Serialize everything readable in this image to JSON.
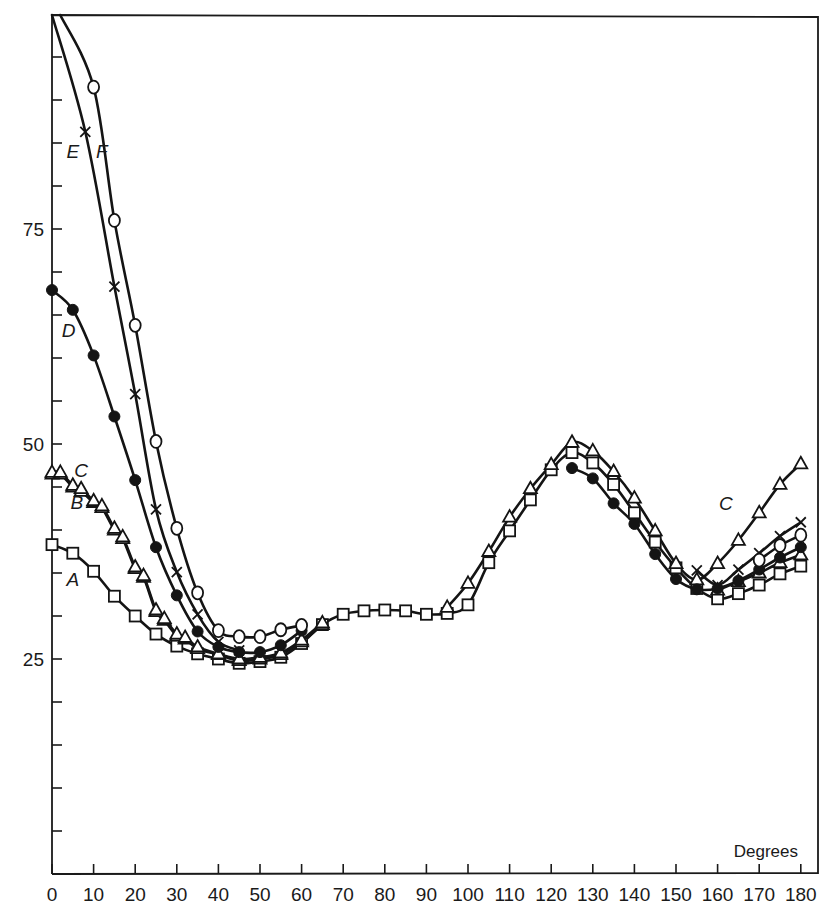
{
  "chart_data": {
    "type": "line",
    "title": "",
    "xlabel": "Degrees",
    "ylabel": "",
    "xlim": [
      0,
      180
    ],
    "ylim": [
      0,
      100
    ],
    "x_ticks": [
      0,
      10,
      20,
      30,
      40,
      50,
      60,
      70,
      80,
      90,
      100,
      110,
      120,
      130,
      140,
      150,
      160,
      170,
      180
    ],
    "x_tick_labels": [
      "0",
      "10",
      "20",
      "30",
      "40",
      "50",
      "60",
      "70",
      "80",
      "90",
      "100",
      "110",
      "120",
      "130",
      "140",
      "150",
      "160",
      "170",
      "180"
    ],
    "y_minor_ticks": [
      5,
      10,
      15,
      20,
      25,
      30,
      35,
      40,
      45,
      50,
      55,
      60,
      65,
      70,
      75,
      80,
      85,
      90,
      95
    ],
    "y_tick_labels": [
      {
        "value": 25,
        "label": "25"
      },
      {
        "value": 50,
        "label": "50"
      },
      {
        "value": 75,
        "label": "75"
      }
    ],
    "grid": false,
    "legend": "inline curve labels",
    "series": [
      {
        "name": "A",
        "marker": "open-square",
        "label_pos": {
          "x": 5,
          "y": 33.5
        },
        "x": [
          0,
          5,
          10,
          15,
          20,
          25,
          30,
          35,
          40,
          45,
          50,
          55,
          60,
          65,
          70,
          75,
          80,
          85,
          90,
          95,
          100,
          105,
          110,
          115,
          120,
          125,
          130,
          135,
          140,
          145,
          150,
          155,
          160,
          165,
          170,
          175,
          180
        ],
        "values": [
          38.3,
          37.3,
          35.2,
          32.3,
          30.0,
          27.9,
          26.5,
          25.6,
          25.0,
          24.5,
          24.7,
          25.2,
          26.8,
          29.0,
          30.2,
          30.6,
          30.7,
          30.6,
          30.2,
          30.3,
          31.3,
          36.2,
          39.9,
          43.5,
          47.0,
          49.0,
          47.8,
          45.3,
          42.0,
          38.6,
          35.6,
          33.2,
          32.0,
          32.6,
          33.6,
          34.9,
          35.8
        ]
      },
      {
        "name": "B",
        "marker": "open-triangle",
        "label_pos": {
          "x": 6,
          "y": 42.5
        },
        "x": [
          0,
          2,
          5,
          7,
          10,
          12,
          15,
          17,
          20,
          22,
          25,
          27,
          30,
          32,
          35,
          40,
          45,
          50,
          55,
          60,
          65,
          160,
          165,
          170,
          175,
          180
        ],
        "values": [
          46.5,
          46.5,
          45.0,
          44.5,
          43.2,
          42.6,
          40.0,
          39.0,
          35.5,
          34.5,
          30.5,
          29.5,
          27.7,
          27.3,
          26.2,
          25.5,
          24.8,
          25.0,
          25.5,
          27.0,
          29.0,
          33.0,
          34.0,
          35.0,
          36.2,
          37.1
        ]
      },
      {
        "name": "C",
        "marker": "open-triangle",
        "label_pos": {
          "x": 7,
          "y": 46.2
        },
        "x": [
          0,
          2,
          5,
          7,
          10,
          12,
          15,
          17,
          20,
          22,
          25,
          27,
          30,
          32,
          35,
          40,
          45,
          50,
          55,
          60,
          65,
          95,
          100,
          105,
          110,
          115,
          120,
          125,
          130,
          135,
          140,
          145,
          150,
          155,
          160,
          165,
          170,
          175,
          180
        ],
        "values": [
          46.7,
          46.7,
          45.2,
          44.8,
          43.4,
          42.8,
          40.2,
          39.2,
          35.7,
          34.7,
          30.7,
          29.7,
          27.9,
          27.5,
          26.4,
          25.6,
          25.0,
          25.2,
          25.7,
          27.2,
          29.2,
          31.0,
          33.8,
          37.5,
          41.5,
          44.8,
          47.6,
          50.2,
          49.2,
          46.8,
          43.7,
          39.9,
          36.1,
          34.2,
          36.1,
          38.8,
          42.0,
          45.3,
          47.7
        ]
      },
      {
        "name": "D",
        "marker": "filled-circle",
        "label_pos": {
          "x": 4,
          "y": 62.5
        },
        "x": [
          0,
          5,
          10,
          15,
          20,
          25,
          30,
          35,
          40,
          45,
          50,
          55,
          60,
          125,
          130,
          135,
          140,
          145,
          150,
          155,
          160,
          165,
          170,
          175,
          180
        ],
        "values": [
          67.9,
          65.6,
          60.3,
          53.2,
          45.8,
          38.0,
          32.4,
          28.2,
          26.4,
          25.8,
          25.8,
          26.6,
          28.3,
          47.2,
          46.0,
          43.1,
          40.7,
          37.2,
          34.3,
          33.1,
          33.2,
          34.1,
          35.4,
          36.8,
          38.0
        ]
      },
      {
        "name": "E",
        "marker": "cross",
        "label_pos": {
          "x": 5,
          "y": 83.2
        },
        "x": [
          0,
          8,
          15,
          20,
          25,
          30,
          35,
          40,
          45,
          155,
          160,
          165,
          170,
          175,
          180
        ],
        "values": [
          100.0,
          86.3,
          68.3,
          55.8,
          42.4,
          35.1,
          30.2,
          27.0,
          26.0,
          35.3,
          33.6,
          35.4,
          37.3,
          39.3,
          40.9
        ]
      },
      {
        "name": "F",
        "marker": "open-circle",
        "label_pos": {
          "x": 12,
          "y": 83.2
        },
        "x": [
          2,
          10,
          15,
          20,
          25,
          30,
          35,
          40,
          45,
          50,
          55,
          60,
          170,
          175,
          180
        ],
        "values": [
          100.0,
          91.5,
          76.0,
          63.8,
          50.3,
          40.2,
          32.7,
          28.3,
          27.6,
          27.6,
          28.4,
          28.9,
          36.5,
          38.2,
          39.4
        ]
      }
    ]
  },
  "plot": {
    "width": 833,
    "height": 916,
    "frame": {
      "left": 52,
      "top": 15,
      "right": 818,
      "bottom": 874
    },
    "axis": {
      "x0": 52,
      "x_per_deg": 4.16,
      "y_at_50": 444,
      "px_per_unit": 8.6
    }
  }
}
